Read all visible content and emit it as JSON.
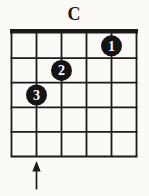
{
  "page": {
    "background": "#fbfaf7"
  },
  "chord": {
    "title": "C"
  },
  "diagram": {
    "type": "guitar-chord-grid",
    "strings": 6,
    "frets": 5,
    "has_nut": true,
    "fingerings": [
      {
        "finger": "1",
        "string_from_left": 5,
        "fret": 1
      },
      {
        "finger": "2",
        "string_from_left": 3,
        "fret": 2
      },
      {
        "finger": "3",
        "string_from_left": 2,
        "fret": 3
      }
    ],
    "arrow": {
      "string_from_left": 2,
      "direction": "up"
    },
    "colors": {
      "line": "#1b1b1b",
      "dot_fill": "#141414",
      "dot_number": "#ffffff",
      "background": "#fbfaf7"
    }
  }
}
